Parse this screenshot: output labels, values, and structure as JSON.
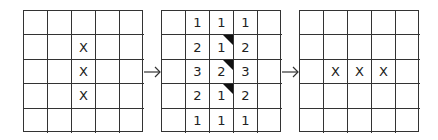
{
  "grids": [
    {
      "name": "before",
      "cells": [
        [
          "",
          "",
          "",
          "",
          ""
        ],
        [
          "",
          "",
          "X",
          "",
          ""
        ],
        [
          "",
          "",
          "X",
          "",
          ""
        ],
        [
          "",
          "",
          "X",
          "",
          ""
        ],
        [
          "",
          "",
          "",
          "",
          ""
        ]
      ]
    },
    {
      "name": "neighbor-counts",
      "cells": [
        [
          "",
          "1",
          "1",
          "1",
          ""
        ],
        [
          "",
          "2",
          "1",
          "2",
          ""
        ],
        [
          "",
          "3",
          "2",
          "3",
          ""
        ],
        [
          "",
          "2",
          "1",
          "2",
          ""
        ],
        [
          "",
          "1",
          "1",
          "1",
          ""
        ]
      ],
      "marked": [
        [
          1,
          2
        ],
        [
          2,
          2
        ],
        [
          3,
          2
        ]
      ]
    },
    {
      "name": "after",
      "cells": [
        [
          "",
          "",
          "",
          "",
          ""
        ],
        [
          "",
          "",
          "",
          "",
          ""
        ],
        [
          "",
          "X",
          "X",
          "X",
          ""
        ],
        [
          "",
          "",
          "",
          "",
          ""
        ],
        [
          "",
          "",
          "",
          "",
          ""
        ]
      ]
    }
  ],
  "arrows": [
    "arrow-right-icon",
    "arrow-right-icon"
  ]
}
